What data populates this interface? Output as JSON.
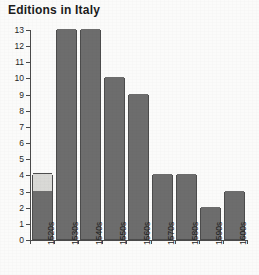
{
  "chart_data": {
    "type": "bar",
    "title": "Editions in Italy",
    "xlabel": "",
    "ylabel": "",
    "categories": [
      "1520s",
      "1530s",
      "1540s",
      "1550s",
      "1560s",
      "1570s",
      "1580s",
      "1590s",
      "1600s"
    ],
    "values": [
      4,
      13,
      13,
      10,
      9,
      4,
      4,
      2,
      3
    ],
    "series": [
      {
        "name": "lower-segment",
        "values": [
          3,
          13,
          13,
          10,
          9,
          4,
          4,
          2,
          3
        ],
        "color": "#6d6d6d"
      },
      {
        "name": "upper-segment",
        "values": [
          1,
          0,
          0,
          0,
          0,
          0,
          0,
          0,
          0
        ],
        "color": "#d9d9d6"
      }
    ],
    "stacked": true,
    "ylim": [
      0,
      13
    ],
    "yticks": [
      0,
      1,
      2,
      3,
      4,
      5,
      6,
      7,
      8,
      9,
      10,
      11,
      12,
      13
    ],
    "ytick_labels": [
      "0",
      "1",
      "2",
      "3",
      "4",
      "5",
      "6",
      "7",
      "8",
      "9",
      "10",
      "11",
      "12",
      "13"
    ],
    "grid": false,
    "legend": "none",
    "colors": {
      "bar_fill": "#6d6d6d",
      "bar_fill_light": "#d9d9d6",
      "bar_border": "#4d4d4d",
      "axis": "#4a4a4a",
      "background": "#fbfbfa",
      "text": "#1f1f1f",
      "title": "#1c1c1c"
    }
  }
}
